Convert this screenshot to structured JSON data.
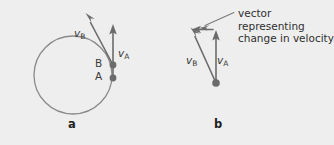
{
  "figure": {
    "background_color": "#eeeeee",
    "ink_color": "#6b6b6b",
    "text_color": "#2e2e2e",
    "width": 334,
    "height": 145
  },
  "panel_a": {
    "caption": "a",
    "point_a_label": "A",
    "point_b_label": "B",
    "velocity_a": {
      "symbol": "v",
      "subscript": "A"
    },
    "velocity_b": {
      "symbol": "v",
      "subscript": "B"
    },
    "circle": {
      "cx": 73,
      "cy": 75,
      "r": 39
    },
    "point_a": {
      "x": 113,
      "y": 78
    },
    "point_b": {
      "x": 113,
      "y": 65
    },
    "vector_a_tip": {
      "x": 113,
      "y": 27
    },
    "vector_b_tip": {
      "x": 87,
      "y": 16
    }
  },
  "panel_b": {
    "caption": "b",
    "velocity_a": {
      "symbol": "v",
      "subscript": "A"
    },
    "velocity_b": {
      "symbol": "v",
      "subscript": "B"
    },
    "annotation": "vector representing\nchange in velocity",
    "origin": {
      "x": 216,
      "y": 83
    },
    "vector_a_tip": {
      "x": 216,
      "y": 33
    },
    "vector_b_tip": {
      "x": 192,
      "y": 32
    },
    "delta_vector": {
      "from_x": 214,
      "from_y": 30,
      "to_x": 194,
      "to_y": 30
    },
    "leader_line": {
      "from_x": 233,
      "from_y": 13,
      "to_x": 201,
      "to_y": 27
    }
  }
}
